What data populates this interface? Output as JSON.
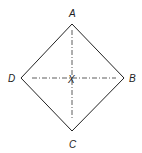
{
  "diagram": {
    "type": "square-diamond",
    "vertices": {
      "A": {
        "label": "A",
        "x": 72,
        "y": 24
      },
      "B": {
        "label": "B",
        "x": 124,
        "y": 78
      },
      "C": {
        "label": "C",
        "x": 72,
        "y": 131
      },
      "D": {
        "label": "D",
        "x": 21,
        "y": 78
      }
    },
    "center": {
      "label": "X",
      "x": 72,
      "y": 78
    },
    "stroke_color": "#222222",
    "axis_line_style": "dash-dot"
  }
}
